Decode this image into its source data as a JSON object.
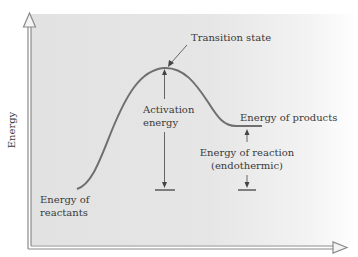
{
  "diagram": {
    "type": "energy-profile",
    "axes": {
      "y_label": "Energy",
      "x_label": ""
    },
    "labels": {
      "transition_state": "Transition state",
      "activation_energy_line1": "Activation",
      "activation_energy_line2": "energy",
      "energy_of_products": "Energy of products",
      "energy_of_reaction_line1": "Energy of reaction",
      "energy_of_reaction_line2": "(endothermic)",
      "energy_of_reactants_line1": "Energy of",
      "energy_of_reactants_line2": "reactants"
    },
    "colors": {
      "panel_background": "#e3e3e3",
      "curve": "#6f6f6f",
      "axis": "#8a8a8a",
      "text": "#3a3a3a"
    }
  }
}
